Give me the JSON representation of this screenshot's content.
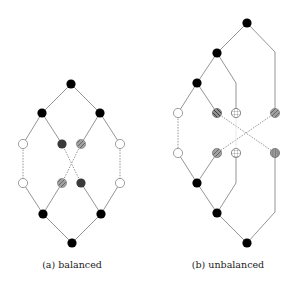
{
  "figure": {
    "colors": {
      "edge": "#7a7a7a",
      "black_node": "#000000",
      "dark_node": "#3a3a3a",
      "light_node": "#a8a8a8",
      "hatched_node": "#9a9a9a",
      "open_node_fill": "#ffffff",
      "open_node_stroke": "#777777"
    },
    "subfigures": [
      {
        "id": "a",
        "caption": "(a) balanced",
        "caption_x": 72,
        "nodes": [
          {
            "id": "a0",
            "x": 71,
            "y": 84,
            "type": "black"
          },
          {
            "id": "a1",
            "x": 42,
            "y": 113,
            "type": "black"
          },
          {
            "id": "a2",
            "x": 100,
            "y": 113,
            "type": "black"
          },
          {
            "id": "a3",
            "x": 23,
            "y": 144,
            "type": "open"
          },
          {
            "id": "a4",
            "x": 62,
            "y": 144,
            "type": "dark"
          },
          {
            "id": "a5",
            "x": 81,
            "y": 144,
            "type": "light-slash"
          },
          {
            "id": "a6",
            "x": 120,
            "y": 144,
            "type": "open"
          },
          {
            "id": "a7",
            "x": 23,
            "y": 183,
            "type": "open-dot"
          },
          {
            "id": "a8",
            "x": 62,
            "y": 183,
            "type": "light-slash"
          },
          {
            "id": "a9",
            "x": 81,
            "y": 183,
            "type": "dark"
          },
          {
            "id": "a10",
            "x": 120,
            "y": 183,
            "type": "open-dot"
          },
          {
            "id": "a11",
            "x": 43,
            "y": 214,
            "type": "black"
          },
          {
            "id": "a12",
            "x": 101,
            "y": 214,
            "type": "black"
          },
          {
            "id": "a13",
            "x": 72,
            "y": 243,
            "type": "black"
          }
        ],
        "edges": [
          {
            "path": [
              [
                71,
                84
              ],
              [
                42,
                113
              ]
            ],
            "style": "solid"
          },
          {
            "path": [
              [
                71,
                84
              ],
              [
                100,
                113
              ]
            ],
            "style": "solid"
          },
          {
            "path": [
              [
                42,
                113
              ],
              [
                23,
                144
              ]
            ],
            "style": "solid"
          },
          {
            "path": [
              [
                42,
                113
              ],
              [
                62,
                144
              ]
            ],
            "style": "solid"
          },
          {
            "path": [
              [
                100,
                113
              ],
              [
                81,
                144
              ]
            ],
            "style": "solid"
          },
          {
            "path": [
              [
                100,
                113
              ],
              [
                120,
                144
              ]
            ],
            "style": "solid"
          },
          {
            "path": [
              [
                23,
                144
              ],
              [
                23,
                183
              ]
            ],
            "style": "dotted"
          },
          {
            "path": [
              [
                120,
                144
              ],
              [
                120,
                183
              ]
            ],
            "style": "dotted"
          },
          {
            "path": [
              [
                62,
                144
              ],
              [
                81,
                183
              ]
            ],
            "style": "dotted"
          },
          {
            "path": [
              [
                81,
                144
              ],
              [
                62,
                183
              ]
            ],
            "style": "dotted"
          },
          {
            "path": [
              [
                23,
                183
              ],
              [
                43,
                214
              ]
            ],
            "style": "solid"
          },
          {
            "path": [
              [
                62,
                183
              ],
              [
                43,
                214
              ]
            ],
            "style": "solid"
          },
          {
            "path": [
              [
                81,
                183
              ],
              [
                101,
                214
              ]
            ],
            "style": "solid"
          },
          {
            "path": [
              [
                120,
                183
              ],
              [
                101,
                214
              ]
            ],
            "style": "solid"
          },
          {
            "path": [
              [
                43,
                214
              ],
              [
                72,
                243
              ]
            ],
            "style": "solid"
          },
          {
            "path": [
              [
                101,
                214
              ],
              [
                72,
                243
              ]
            ],
            "style": "solid"
          }
        ]
      },
      {
        "id": "b",
        "caption": "(b) unbalanced",
        "caption_x": 228,
        "nodes": [
          {
            "id": "b0",
            "x": 247,
            "y": 23,
            "type": "black"
          },
          {
            "id": "b1",
            "x": 217,
            "y": 53,
            "type": "black"
          },
          {
            "id": "b2",
            "x": 197,
            "y": 83,
            "type": "black"
          },
          {
            "id": "b3",
            "x": 178,
            "y": 113,
            "type": "open"
          },
          {
            "id": "b4",
            "x": 217,
            "y": 113,
            "type": "hatch-backslash"
          },
          {
            "id": "b5",
            "x": 236,
            "y": 113,
            "type": "grid"
          },
          {
            "id": "b6",
            "x": 275,
            "y": 113,
            "type": "hatch-slash"
          },
          {
            "id": "b7",
            "x": 178,
            "y": 153,
            "type": "open-dot"
          },
          {
            "id": "b8",
            "x": 217,
            "y": 153,
            "type": "hatch-slash"
          },
          {
            "id": "b9",
            "x": 236,
            "y": 153,
            "type": "grid"
          },
          {
            "id": "b10",
            "x": 275,
            "y": 153,
            "type": "hatch-vertical"
          },
          {
            "id": "b11",
            "x": 197,
            "y": 183,
            "type": "black"
          },
          {
            "id": "b12",
            "x": 217,
            "y": 213,
            "type": "black"
          },
          {
            "id": "b13",
            "x": 247,
            "y": 243,
            "type": "black"
          }
        ],
        "edges": [
          {
            "path": [
              [
                247,
                23
              ],
              [
                217,
                53
              ]
            ],
            "style": "solid"
          },
          {
            "path": [
              [
                247,
                23
              ],
              [
                275,
                52
              ],
              [
                275,
                113
              ]
            ],
            "style": "solid"
          },
          {
            "path": [
              [
                217,
                53
              ],
              [
                197,
                83
              ]
            ],
            "style": "solid"
          },
          {
            "path": [
              [
                217,
                53
              ],
              [
                236,
                83
              ],
              [
                236,
                113
              ]
            ],
            "style": "solid"
          },
          {
            "path": [
              [
                197,
                83
              ],
              [
                178,
                113
              ]
            ],
            "style": "solid"
          },
          {
            "path": [
              [
                197,
                83
              ],
              [
                217,
                113
              ]
            ],
            "style": "solid"
          },
          {
            "path": [
              [
                178,
                113
              ],
              [
                178,
                153
              ]
            ],
            "style": "dotted"
          },
          {
            "path": [
              [
                217,
                113
              ],
              [
                275,
                153
              ]
            ],
            "style": "dotted"
          },
          {
            "path": [
              [
                275,
                113
              ],
              [
                217,
                153
              ]
            ],
            "style": "dotted"
          },
          {
            "path": [
              [
                236,
                113
              ],
              [
                236,
                153
              ]
            ],
            "style": "faint"
          },
          {
            "path": [
              [
                178,
                153
              ],
              [
                197,
                183
              ]
            ],
            "style": "solid"
          },
          {
            "path": [
              [
                217,
                153
              ],
              [
                197,
                183
              ]
            ],
            "style": "solid"
          },
          {
            "path": [
              [
                197,
                183
              ],
              [
                217,
                213
              ]
            ],
            "style": "solid"
          },
          {
            "path": [
              [
                236,
                153
              ],
              [
                236,
                183
              ],
              [
                217,
                213
              ]
            ],
            "style": "solid"
          },
          {
            "path": [
              [
                217,
                213
              ],
              [
                247,
                243
              ]
            ],
            "style": "solid"
          },
          {
            "path": [
              [
                275,
                153
              ],
              [
                275,
                212
              ],
              [
                247,
                243
              ]
            ],
            "style": "solid"
          }
        ]
      }
    ]
  }
}
